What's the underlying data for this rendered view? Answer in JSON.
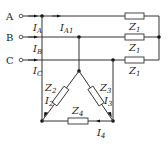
{
  "diagram": {
    "type": "three-phase circuit",
    "phases": [
      {
        "label": "A",
        "y": 16
      },
      {
        "label": "B",
        "y": 37
      },
      {
        "label": "C",
        "y": 60
      }
    ],
    "line_currents": [
      {
        "name": "I",
        "sub": "A"
      },
      {
        "name": "I",
        "sub": "B"
      },
      {
        "name": "I",
        "sub": "C"
      }
    ],
    "star_load": {
      "impedance_label": "Z",
      "impedance_sub": "1",
      "branch_current": {
        "name": "I",
        "sub": "A1"
      }
    },
    "delta_load": {
      "impedances": [
        {
          "name": "Z",
          "sub": "2"
        },
        {
          "name": "Z",
          "sub": "3"
        },
        {
          "name": "Z",
          "sub": "4"
        }
      ],
      "currents": [
        {
          "name": "I",
          "sub": "2"
        },
        {
          "name": "I",
          "sub": "3"
        },
        {
          "name": "I",
          "sub": "4"
        }
      ]
    }
  }
}
